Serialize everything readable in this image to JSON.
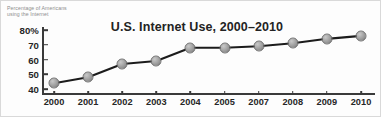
{
  "chart_data": {
    "type": "line",
    "title": "U.S. Internet Use, 2000–2010",
    "xlabel": "",
    "ylabel": "Percentage of Americans using the Internet",
    "ylabel_line1": "Percentage of Americans",
    "ylabel_line2": "using the Internet",
    "categories": [
      "2000",
      "2001",
      "2002",
      "2003",
      "2004",
      "2005",
      "2007",
      "2008",
      "2009",
      "2010"
    ],
    "values": [
      44,
      48,
      57,
      59,
      68,
      68,
      69,
      71,
      74,
      76
    ],
    "ylim": [
      36,
      82
    ],
    "yticks": [
      80,
      70,
      60,
      50,
      40
    ],
    "ytick_labels": [
      "80%",
      "70",
      "60",
      "50",
      "40"
    ],
    "grid": false,
    "legend": null,
    "marker": "circle",
    "line_color": "#1c1c1c",
    "marker_fill": "#a3a3a3",
    "marker_edge": "#6f6f6f",
    "axis_color": "#3a3a3a",
    "text_color": "#262626",
    "caption_color": "#8d8d8d",
    "background": "#fdfdfd"
  }
}
